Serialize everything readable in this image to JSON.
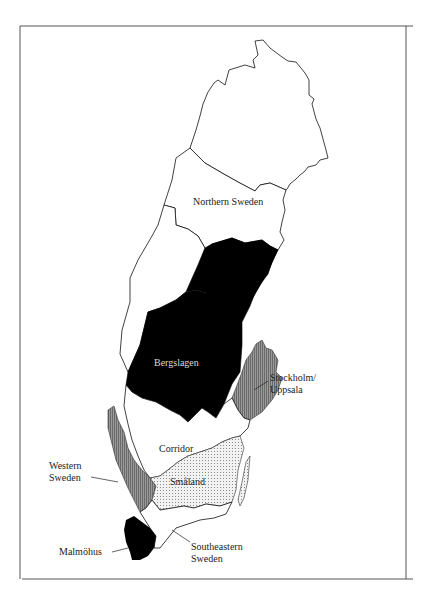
{
  "map": {
    "subject": "Regions of Sweden",
    "regions": [
      {
        "id": "northern-sweden",
        "label": "Northern Sweden",
        "fill": "#ffffff",
        "pattern": "none"
      },
      {
        "id": "bergslagen",
        "label": "Bergslagen",
        "fill": "#000000",
        "pattern": "solid"
      },
      {
        "id": "stockholm-uppsala",
        "label_line1": "Stockholm/",
        "label_line2": "Uppsala",
        "fill": "#8a8a8a",
        "pattern": "vertical-hatch"
      },
      {
        "id": "corridor",
        "label": "Corridor",
        "fill": "#ffffff",
        "pattern": "none"
      },
      {
        "id": "smaland",
        "label": "Småland",
        "fill": "#e6e6e6",
        "pattern": "dots"
      },
      {
        "id": "western-sweden",
        "label_line1": "Western",
        "label_line2": "Sweden",
        "fill": "#8a8a8a",
        "pattern": "vertical-hatch"
      },
      {
        "id": "malmohus",
        "label": "Malmöhus",
        "fill": "#000000",
        "pattern": "solid"
      },
      {
        "id": "southeastern-sweden",
        "label_line1": "Southeastern",
        "label_line2": "Sweden",
        "fill": "#ffffff",
        "pattern": "none"
      }
    ]
  }
}
